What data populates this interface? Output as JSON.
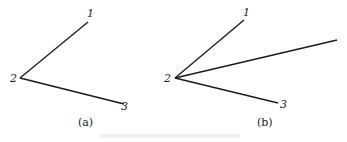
{
  "figure": {
    "panels": [
      {
        "caption": "(a)",
        "points": [
          {
            "label": "1",
            "x": 88,
            "y": 22
          },
          {
            "label": "2",
            "x": 20,
            "y": 78
          },
          {
            "label": "3",
            "x": 124,
            "y": 104
          }
        ],
        "segments": [
          [
            1,
            0
          ],
          [
            1,
            2
          ]
        ]
      },
      {
        "caption": "(b)",
        "points": [
          {
            "label": "1",
            "x": 244,
            "y": 20
          },
          {
            "label": "2",
            "x": 175,
            "y": 78
          },
          {
            "label": "3",
            "x": 278,
            "y": 103
          },
          {
            "label": "",
            "x": 337,
            "y": 40
          }
        ],
        "segments": [
          [
            1,
            0
          ],
          [
            1,
            2
          ],
          [
            1,
            3
          ]
        ]
      }
    ]
  }
}
